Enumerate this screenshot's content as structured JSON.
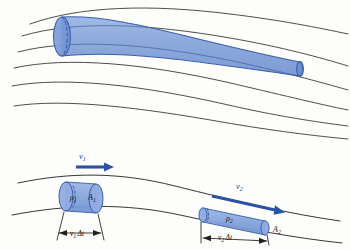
{
  "figure": {
    "colors": {
      "tube_fill": "#8aa8dd",
      "tube_fill_dark": "#7396d2",
      "tube_stroke": "#3a5fae",
      "arrow_blue": "#2c52a8",
      "streamline": "#3a3a38",
      "label_black": "#141414",
      "label_blue": "#1c3f9c",
      "background": "#fdfdfc"
    }
  },
  "top_panel": {
    "name": "flow-tube-perspective",
    "description": "Tapering flow tube bounded by curved streamlines",
    "streamline_count": 6,
    "tube": {
      "inlet_label": "",
      "outlet_label": "",
      "has_dashed_back_edge": true
    }
  },
  "bottom_panel": {
    "name": "continuity-elements",
    "streamline_count": 2,
    "element_1": {
      "velocity_label": "v",
      "velocity_sub": "1",
      "density_label": "ρ",
      "density_sub": "1",
      "area_label": "A",
      "area_sub": "1",
      "length_label": "v",
      "length_sub": "1",
      "length_delta": "Δt"
    },
    "element_2": {
      "velocity_label": "v",
      "velocity_sub": "2",
      "density_label": "ρ",
      "density_sub": "2",
      "area_label": "A",
      "area_sub": "2",
      "length_label": "v",
      "length_sub": "2",
      "length_delta": "Δt"
    }
  }
}
